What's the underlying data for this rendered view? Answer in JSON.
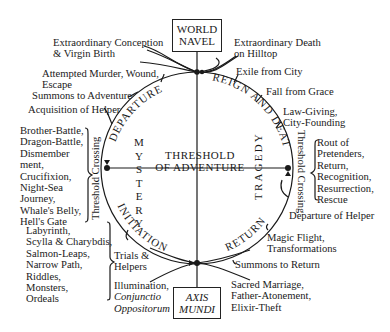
{
  "diagram": {
    "title_top_box": [
      "WORLD",
      "NAVEL"
    ],
    "title_bottom_box": [
      "AXIS",
      "MUNDI"
    ],
    "center_label": [
      "THRESHOLD",
      "OF ADVENTURE"
    ],
    "arc_labels": {
      "top_left": "DEPARTURE",
      "top_right": "REIGN AND DEATH",
      "bottom_left": "INITIATION",
      "bottom_right": "RETURN"
    },
    "inner_vertical_labels": {
      "left": "MYSTERY",
      "right": "TRAGEDY"
    },
    "threshold_crossing_left": "Threshold Crossing",
    "threshold_crossing_right": "Threshold Crossing",
    "stages": {
      "extraordinary_conception": [
        "Extraordinary Conception",
        "& Virgin Birth"
      ],
      "attempted_murder": [
        "Attempted Murder, Wound,",
        "Escape"
      ],
      "summons_to_adventure": "Summons to Adventure",
      "acquisition_of_helper": "Acquisition of Helper",
      "extraordinary_death": [
        "Extraordinary Death",
        "on Hilltop"
      ],
      "exile_from_city": "Exile from City",
      "fall_from_grace": "Fall from Grace",
      "law_giving": [
        "Law-Giving,",
        "City-Founding"
      ],
      "departure_of_helper": "Departure of Helper",
      "magic_flight": [
        "Magic Flight,",
        "Transformations"
      ],
      "summons_to_return": "Summons to Return",
      "sacred_marriage": [
        "Sacred Marriage,",
        "Father-Atonement,",
        "Elixir-Theft"
      ],
      "trials_helpers": [
        "Trials &",
        "Helpers"
      ],
      "illumination": [
        "Illumination,",
        "Conjunctio",
        "Oppositorum"
      ]
    },
    "lists": {
      "left_threshold": [
        "Brother-Battle,",
        "Dragon-Battle,",
        "Dismember",
        "ment,",
        "Crucifixion,",
        "Night-Sea",
        "Journey,",
        "Whale's Belly,",
        "Hell's Gate"
      ],
      "right_threshold": [
        "Rout of",
        "Pretenders,",
        "Return,",
        "Recognition,",
        "Resurrection,",
        "Rescue"
      ],
      "initiation_trials": [
        "Labyrinth,",
        "Scylla & Charybdis,",
        "Salmon-Leaps,",
        "Narrow Path,",
        "Riddles,",
        "Monsters,",
        "Ordeals"
      ]
    },
    "geometry": {
      "center_x": 197,
      "center_y": 168,
      "radius": 96,
      "line_color": "#1a1a1a"
    }
  }
}
